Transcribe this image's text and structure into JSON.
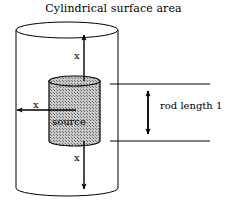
{
  "figure": {
    "title": "Cylindrical surface area",
    "labels": {
      "x_top": "x",
      "x_left": "x",
      "x_bottom": "x",
      "source": "source",
      "rod_length": "rod length 1"
    },
    "colors": {
      "stroke": "#000000",
      "background": "#ffffff",
      "inner_cylinder_fill": "#bdbdbd"
    },
    "shapes": {
      "outer_cylinder": {
        "name": "outer-cylinder",
        "left": 16,
        "right": 118,
        "top_ellipse_cy": 30,
        "bottom_ellipse_cy": 188,
        "ellipse_ry": 8
      },
      "inner_cylinder": {
        "name": "inner-cylinder-source",
        "left": 49,
        "right": 100,
        "top_ellipse_cy": 81,
        "bottom_ellipse_cy": 141,
        "ellipse_ry": 5
      },
      "arrow_x_top": {
        "x": 84,
        "y_from": 81,
        "y_to": 34
      },
      "arrow_x_bottom": {
        "x": 84,
        "y_from": 141,
        "y_to": 190
      },
      "arrow_x_left": {
        "y": 110,
        "x_from": 76,
        "x_to": 17
      },
      "dimension": {
        "top_line_y": 84,
        "bottom_line_y": 141,
        "line_x_from": 110,
        "line_x_to": 210,
        "arrow_x": 148
      }
    }
  }
}
